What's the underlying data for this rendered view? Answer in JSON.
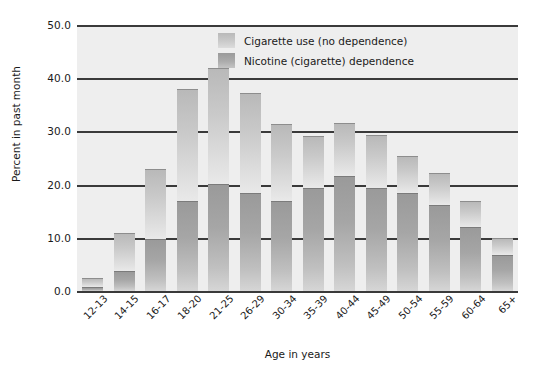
{
  "chart_data": {
    "type": "bar",
    "title": "",
    "stacked": true,
    "xlabel": "Age in years",
    "ylabel": "Percent in past month",
    "ylim": [
      0,
      50
    ],
    "yticks": [
      "0.0",
      "10.0",
      "20.0",
      "30.0",
      "40.0",
      "50.0"
    ],
    "ytick_values": [
      0,
      10,
      20,
      30,
      40,
      50
    ],
    "grid": "horizontal",
    "legend_position": "top-right",
    "categories": [
      "12-13",
      "14-15",
      "16-17",
      "18-20",
      "21-25",
      "26-29",
      "30-34",
      "35-39",
      "40-44",
      "45-49",
      "50-54",
      "55-59",
      "60-64",
      "65+"
    ],
    "series": [
      {
        "name": "Nicotine (cigarette) dependence",
        "color": "#a6a6a6",
        "values": [
          0.7,
          3.8,
          9.8,
          16.9,
          20.2,
          18.4,
          16.9,
          19.3,
          21.6,
          19.4,
          18.5,
          16.2,
          12.0,
          6.8
        ]
      },
      {
        "name": "Cigarette use (no dependence)",
        "color": "#cacaca",
        "values": [
          1.8,
          7.2,
          13.2,
          21.1,
          21.8,
          18.9,
          14.5,
          9.9,
          10.0,
          9.9,
          6.8,
          5.9,
          5.0,
          3.1
        ]
      }
    ],
    "totals": [
      2.5,
      11.0,
      23.0,
      38.0,
      42.0,
      37.3,
      31.4,
      29.2,
      31.6,
      29.3,
      25.3,
      22.1,
      17.0,
      9.9
    ]
  },
  "legend": {
    "items": [
      {
        "label": "Cigarette use (no dependence)",
        "swatch": "light-gray-swatch"
      },
      {
        "label": "Nicotine (cigarette) dependence",
        "swatch": "dark-gray-swatch"
      }
    ]
  },
  "axes": {
    "y_title": "Percent in past month",
    "x_title": "Age in years"
  }
}
